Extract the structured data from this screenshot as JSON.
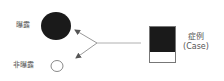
{
  "diagram": {
    "type": "case-exposure-schematic",
    "exposed": {
      "label": "曝露",
      "shape": "filled-circle",
      "color": "#1a1a1a"
    },
    "unexposed": {
      "label": "非曝露",
      "shape": "hollow-circle",
      "color": "#888888"
    },
    "case": {
      "label_line1": "症例",
      "label_line2": "(Case)",
      "fill_color": "#1a1a1a",
      "border_color": "#777777"
    },
    "arrows": {
      "color": "#9a9a9a",
      "from": "case",
      "to": [
        "exposed",
        "unexposed"
      ]
    }
  }
}
